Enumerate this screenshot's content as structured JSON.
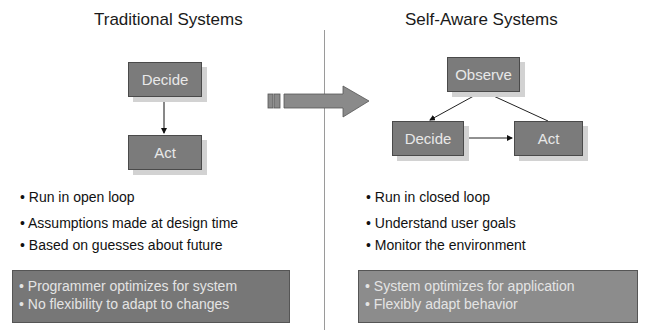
{
  "left": {
    "title": "Traditional Systems",
    "diagram": {
      "decide": "Decide",
      "act": "Act"
    },
    "bullets": [
      "• Run in open loop",
      "• Assumptions made at design time",
      "• Based on guesses about future"
    ],
    "panel": [
      "• Programmer optimizes for system",
      "• No flexibility to adapt to changes"
    ]
  },
  "right": {
    "title": "Self-Aware Systems",
    "diagram": {
      "observe": "Observe",
      "decide": "Decide",
      "act": "Act"
    },
    "bullets": [
      "• Run in closed loop",
      "• Understand user goals",
      "• Monitor the environment"
    ],
    "panel": [
      "• System optimizes for application",
      "• Flexibly adapt behavior"
    ]
  },
  "colors": {
    "box_fill": "#7b7b7b",
    "box_border": "#4a4a4a",
    "panel_left": "#777777",
    "panel_right": "#8c8c8c",
    "arrow": "#8a8a8a"
  }
}
